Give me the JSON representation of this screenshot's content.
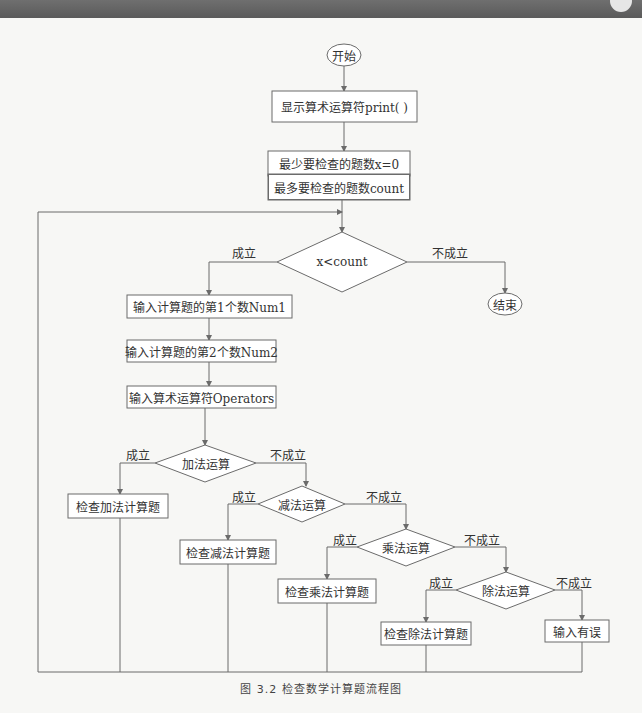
{
  "diagram": {
    "caption": "图 3.2   检查数学计算题流程图",
    "nodes": {
      "start": "开始",
      "show_operators": "显示算术运算符print( )",
      "min_count": "最少要检查的题数x=0",
      "max_count": "最多要检查的题数count",
      "loop_condition": "x<count",
      "end": "结束",
      "input_num1": "输入计算题的第1个数Num1",
      "input_num2": "输入计算题的第2个数Num2",
      "input_operator": "输入算术运算符Operators",
      "is_add": "加法运算",
      "check_add": "检查加法计算题",
      "is_sub": "减法运算",
      "check_sub": "检查减法计算题",
      "is_mul": "乘法运算",
      "check_mul": "检查乘法计算题",
      "is_div": "除法运算",
      "check_div": "检查除法计算题",
      "input_error": "输入有误"
    },
    "edge_labels": {
      "loop_yes": "成立",
      "loop_no": "不成立",
      "add_yes": "成立",
      "add_no": "不成立",
      "sub_yes": "成立",
      "sub_no": "不成立",
      "mul_yes": "成立",
      "mul_no": "不成立",
      "div_yes": "成立",
      "div_no": "不成立"
    },
    "colors": {
      "line": "#6b6b6b",
      "text": "#333333",
      "background": "#f7f7f5"
    }
  }
}
